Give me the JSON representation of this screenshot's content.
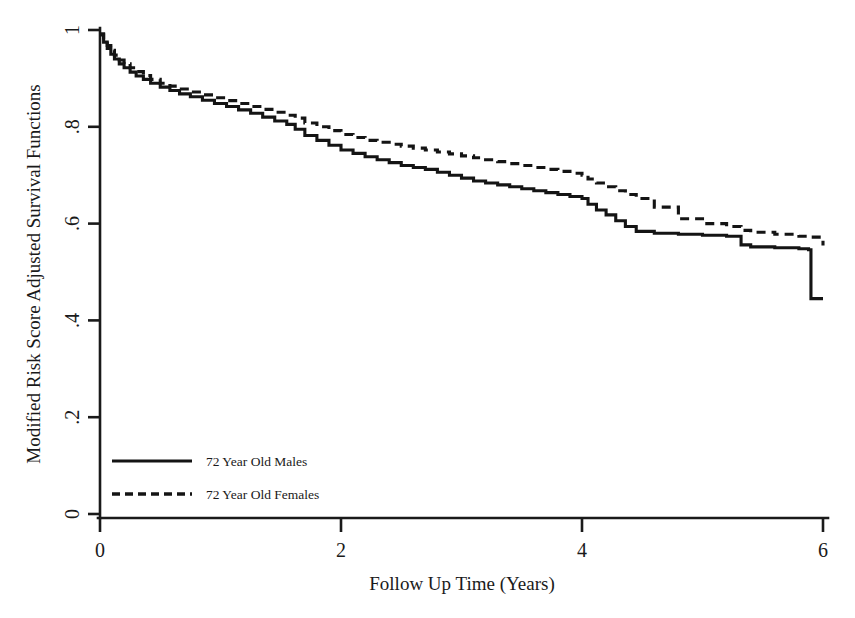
{
  "chart_data": {
    "type": "line",
    "title": "",
    "subtitle": "",
    "xlabel": "Follow Up Time (Years)",
    "ylabel": "Modified Risk Score Adjusted Survival Functions",
    "xlim": [
      0,
      6
    ],
    "ylim": [
      0,
      1
    ],
    "xticks": [
      0,
      2,
      4,
      6
    ],
    "xticklabels": [
      "0",
      "2",
      "4",
      "6"
    ],
    "yticks": [
      0,
      0.2,
      0.4,
      0.6,
      0.8,
      1
    ],
    "yticklabels": [
      "0",
      ".2",
      ".4",
      ".6",
      ".8",
      "1"
    ],
    "grid": false,
    "legend_position": "lower-left-inside",
    "series": [
      {
        "name": "72 Year Old Males",
        "style": "solid",
        "color": "#141414",
        "x": [
          0.0,
          0.03,
          0.06,
          0.09,
          0.12,
          0.16,
          0.2,
          0.25,
          0.3,
          0.36,
          0.42,
          0.5,
          0.58,
          0.66,
          0.75,
          0.85,
          0.95,
          1.05,
          1.15,
          1.25,
          1.35,
          1.45,
          1.55,
          1.62,
          1.7,
          1.8,
          1.9,
          2.0,
          2.1,
          2.2,
          2.3,
          2.4,
          2.5,
          2.6,
          2.7,
          2.8,
          2.9,
          3.0,
          3.1,
          3.2,
          3.3,
          3.4,
          3.5,
          3.6,
          3.7,
          3.8,
          3.9,
          4.0,
          4.05,
          4.12,
          4.2,
          4.28,
          4.36,
          4.45,
          4.6,
          4.8,
          5.0,
          5.2,
          5.32,
          5.4,
          5.6,
          5.8,
          5.88,
          5.9,
          6.0
        ],
        "y": [
          0.99,
          0.975,
          0.962,
          0.95,
          0.94,
          0.93,
          0.922,
          0.913,
          0.905,
          0.898,
          0.89,
          0.882,
          0.875,
          0.868,
          0.862,
          0.855,
          0.848,
          0.842,
          0.835,
          0.828,
          0.82,
          0.812,
          0.805,
          0.795,
          0.782,
          0.772,
          0.762,
          0.752,
          0.745,
          0.738,
          0.732,
          0.726,
          0.72,
          0.716,
          0.712,
          0.706,
          0.7,
          0.694,
          0.688,
          0.684,
          0.68,
          0.676,
          0.672,
          0.668,
          0.664,
          0.66,
          0.656,
          0.652,
          0.64,
          0.628,
          0.618,
          0.606,
          0.594,
          0.584,
          0.58,
          0.578,
          0.576,
          0.574,
          0.556,
          0.552,
          0.55,
          0.548,
          0.546,
          0.445,
          0.445
        ],
        "final_value": 0.445
      },
      {
        "name": "72 Year Old Females",
        "style": "dashed",
        "color": "#141414",
        "x": [
          0.0,
          0.03,
          0.06,
          0.09,
          0.12,
          0.16,
          0.2,
          0.25,
          0.3,
          0.36,
          0.42,
          0.5,
          0.58,
          0.66,
          0.75,
          0.85,
          0.95,
          1.05,
          1.15,
          1.25,
          1.35,
          1.45,
          1.55,
          1.62,
          1.7,
          1.8,
          1.9,
          2.0,
          2.1,
          2.2,
          2.3,
          2.4,
          2.5,
          2.6,
          2.7,
          2.8,
          2.9,
          3.0,
          3.1,
          3.2,
          3.3,
          3.4,
          3.5,
          3.6,
          3.7,
          3.8,
          3.9,
          4.0,
          4.05,
          4.12,
          4.2,
          4.28,
          4.36,
          4.45,
          4.6,
          4.8,
          5.0,
          5.2,
          5.32,
          5.4,
          5.6,
          5.8,
          5.88,
          6.0
        ],
        "y": [
          0.992,
          0.98,
          0.968,
          0.958,
          0.948,
          0.938,
          0.93,
          0.922,
          0.914,
          0.906,
          0.898,
          0.89,
          0.884,
          0.878,
          0.872,
          0.866,
          0.86,
          0.854,
          0.848,
          0.842,
          0.836,
          0.83,
          0.824,
          0.818,
          0.808,
          0.8,
          0.792,
          0.784,
          0.778,
          0.772,
          0.768,
          0.764,
          0.76,
          0.756,
          0.752,
          0.748,
          0.744,
          0.74,
          0.736,
          0.732,
          0.728,
          0.724,
          0.72,
          0.716,
          0.712,
          0.708,
          0.704,
          0.7,
          0.692,
          0.684,
          0.676,
          0.668,
          0.66,
          0.652,
          0.634,
          0.61,
          0.6,
          0.594,
          0.586,
          0.582,
          0.578,
          0.574,
          0.572,
          0.555
        ],
        "final_value": 0.555
      }
    ],
    "legend": [
      {
        "label": "72 Year Old Males",
        "style": "solid"
      },
      {
        "label": "72 Year Old Females",
        "style": "dashed"
      }
    ]
  },
  "axis": {
    "x_title": "Follow Up Time (Years)",
    "y_title": "Modified Risk Score Adjusted Survival Functions"
  }
}
